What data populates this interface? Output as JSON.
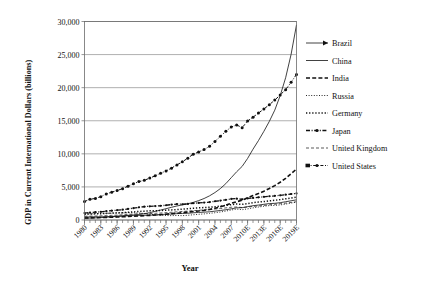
{
  "chart_data": {
    "type": "line",
    "title": "",
    "xlabel": "Year",
    "ylabel": "GDP in Current International Dollars (billions)",
    "ylim": [
      0,
      30000
    ],
    "yticks": [
      0,
      5000,
      10000,
      15000,
      20000,
      25000,
      30000
    ],
    "ytick_labels": [
      "0",
      "5,000",
      "10,000",
      "15,000",
      "20,000",
      "25,000",
      "30,000"
    ],
    "grid": true,
    "legend_position": "right",
    "x": [
      1980,
      1981,
      1982,
      1983,
      1984,
      1985,
      1986,
      1987,
      1988,
      1989,
      1990,
      1991,
      1992,
      1993,
      1994,
      1995,
      1996,
      1997,
      1998,
      1999,
      2000,
      2001,
      2002,
      2003,
      2004,
      2005,
      2006,
      2007,
      2008,
      2009,
      2010,
      2011,
      2012,
      2013,
      2014,
      2015,
      2016,
      2017,
      2018,
      2019
    ],
    "xtick_labels": [
      "1980",
      "1983",
      "1986",
      "1989",
      "1992",
      "1995",
      "1998",
      "2001",
      "2004",
      "2007",
      "2010E",
      "2013E",
      "2016E",
      "2019E"
    ],
    "xticks": [
      1980,
      1983,
      1986,
      1989,
      1992,
      1995,
      1998,
      2001,
      2004,
      2007,
      2010,
      2013,
      2016,
      2019
    ],
    "series": [
      {
        "name": "Brazil",
        "style": "solid-arrow",
        "values": [
          430,
          470,
          490,
          470,
          500,
          540,
          580,
          610,
          640,
          660,
          690,
          710,
          730,
          770,
          820,
          870,
          910,
          960,
          990,
          1020,
          1090,
          1140,
          1190,
          1240,
          1340,
          1440,
          1550,
          1690,
          1840,
          1860,
          2020,
          2160,
          2260,
          2370,
          2480,
          2520,
          2620,
          2760,
          2900,
          3050
        ]
      },
      {
        "name": "China",
        "style": "solid",
        "values": [
          250,
          290,
          320,
          360,
          420,
          490,
          540,
          610,
          700,
          770,
          840,
          950,
          1110,
          1300,
          1500,
          1710,
          1920,
          2120,
          2280,
          2450,
          2660,
          2930,
          3250,
          3650,
          4150,
          4750,
          5500,
          6400,
          7300,
          8100,
          9300,
          10700,
          12000,
          13400,
          14900,
          16600,
          18800,
          21500,
          25000,
          29500
        ]
      },
      {
        "name": "India",
        "style": "dashed",
        "values": [
          300,
          320,
          340,
          370,
          390,
          420,
          450,
          480,
          520,
          570,
          620,
          650,
          700,
          750,
          810,
          880,
          960,
          1020,
          1100,
          1200,
          1290,
          1370,
          1460,
          1600,
          1780,
          1990,
          2240,
          2520,
          2760,
          3000,
          3350,
          3700,
          4000,
          4350,
          4750,
          5200,
          5700,
          6300,
          7000,
          7700
        ]
      },
      {
        "name": "Russia",
        "style": "dotted-fine",
        "values": [
          900,
          930,
          960,
          990,
          1010,
          1030,
          1050,
          1070,
          1090,
          1100,
          1050,
          980,
          860,
          790,
          710,
          680,
          660,
          680,
          660,
          710,
          790,
          860,
          920,
          1000,
          1100,
          1210,
          1350,
          1510,
          1650,
          1560,
          1680,
          1830,
          1960,
          2080,
          2180,
          2200,
          2280,
          2400,
          2560,
          2700
        ]
      },
      {
        "name": "Germany",
        "style": "dotted-bold",
        "values": [
          880,
          910,
          930,
          960,
          1000,
          1040,
          1080,
          1110,
          1160,
          1220,
          1290,
          1340,
          1380,
          1390,
          1440,
          1490,
          1530,
          1580,
          1640,
          1700,
          1780,
          1840,
          1880,
          1930,
          2010,
          2080,
          2200,
          2320,
          2420,
          2370,
          2470,
          2620,
          2710,
          2790,
          2900,
          2980,
          3080,
          3200,
          3330,
          3460
        ]
      },
      {
        "name": "Japan",
        "style": "dash-dot-bold",
        "values": [
          1050,
          1120,
          1180,
          1240,
          1330,
          1410,
          1480,
          1560,
          1680,
          1790,
          1910,
          2020,
          2070,
          2100,
          2150,
          2230,
          2330,
          2400,
          2380,
          2430,
          2530,
          2580,
          2630,
          2710,
          2830,
          2930,
          3050,
          3180,
          3230,
          3120,
          3260,
          3330,
          3420,
          3510,
          3590,
          3650,
          3730,
          3830,
          3930,
          4020
        ]
      },
      {
        "name": "United Kingdom",
        "style": "dashed-fine",
        "values": [
          560,
          580,
          600,
          630,
          660,
          700,
          730,
          780,
          840,
          890,
          930,
          950,
          970,
          1010,
          1060,
          1110,
          1170,
          1230,
          1290,
          1340,
          1410,
          1470,
          1520,
          1580,
          1660,
          1730,
          1830,
          1930,
          1960,
          1880,
          1960,
          2050,
          2120,
          2200,
          2300,
          2380,
          2460,
          2550,
          2650,
          2760
        ]
      },
      {
        "name": "United States",
        "style": "dash-dot-marker",
        "values": [
          2790,
          3130,
          3260,
          3530,
          3930,
          4210,
          4450,
          4740,
          5100,
          5480,
          5800,
          5990,
          6340,
          6670,
          7080,
          7410,
          7840,
          8330,
          8790,
          9350,
          9950,
          10290,
          10640,
          11140,
          11870,
          12640,
          13400,
          14060,
          14370,
          13950,
          14960,
          15530,
          16160,
          16770,
          17430,
          18120,
          18900,
          19700,
          20800,
          22000
        ]
      }
    ]
  },
  "legend": {
    "items": [
      {
        "label": "Brazil"
      },
      {
        "label": "China"
      },
      {
        "label": "India"
      },
      {
        "label": "Russia"
      },
      {
        "label": "Germany"
      },
      {
        "label": "Japan"
      },
      {
        "label": "United Kingdom"
      },
      {
        "label": "United States"
      }
    ]
  }
}
